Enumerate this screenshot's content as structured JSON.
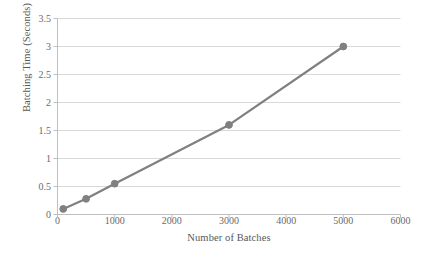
{
  "chart_data": {
    "type": "line",
    "title": "",
    "xlabel": "Number of Batches",
    "ylabel": "Batching Time (Seconds)",
    "x": [
      100,
      500,
      1000,
      3000,
      5000
    ],
    "values": [
      0.1,
      0.28,
      0.55,
      1.6,
      3.0
    ],
    "series": [
      {
        "name": "Batching Time",
        "x": [
          100,
          500,
          1000,
          3000,
          5000
        ],
        "values": [
          0.1,
          0.28,
          0.55,
          1.6,
          3.0
        ]
      }
    ],
    "xlim": [
      0,
      6000
    ],
    "ylim": [
      0,
      3.5
    ],
    "xticks": [
      0,
      1000,
      2000,
      3000,
      4000,
      5000,
      6000
    ],
    "yticks": [
      0,
      0.5,
      1,
      1.5,
      2,
      2.5,
      3,
      3.5
    ],
    "xticklabels": [
      "0",
      "1000",
      "2000",
      "3000",
      "4000",
      "5000",
      "6000"
    ],
    "yticklabels": [
      "0",
      "0.5",
      "1",
      "1.5",
      "2",
      "2.5",
      "3",
      "3.5"
    ],
    "grid": "horizontal",
    "legend": "none",
    "line_color": "#808080",
    "marker_color": "#808080",
    "grid_color": "#d9d9d9",
    "axis_color": "#bfbfbf",
    "background": "#ffffff"
  }
}
